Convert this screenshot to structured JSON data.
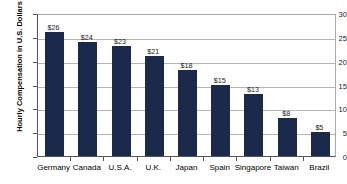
{
  "chart_data": {
    "type": "bar",
    "title": "",
    "xlabel": "",
    "ylabel": "Hourly Compensation in U.S. Dollars",
    "ylim": [
      0,
      30
    ],
    "yticks": [
      0,
      5,
      10,
      15,
      20,
      25,
      30
    ],
    "ytick_labels": [
      "0",
      "5",
      "10",
      "15",
      "20",
      "25",
      "30"
    ],
    "grid": true,
    "legend": false,
    "value_prefix": "$",
    "categories": [
      "Germany",
      "Canada",
      "U.S.A.",
      "U.K.",
      "Japan",
      "Spain",
      "Singapore",
      "Taiwan",
      "Brazil"
    ],
    "values": [
      26,
      24,
      23,
      21,
      18,
      15,
      13,
      8,
      5
    ],
    "data_labels": [
      "$26",
      "$24",
      "$23",
      "$21",
      "$18",
      "$15",
      "$13",
      "$8",
      "$5"
    ],
    "bar_color": "#1b2a4a",
    "grid_color": "#b5b5b5",
    "axis_color": "#555555",
    "background_color": "#ffffff"
  }
}
